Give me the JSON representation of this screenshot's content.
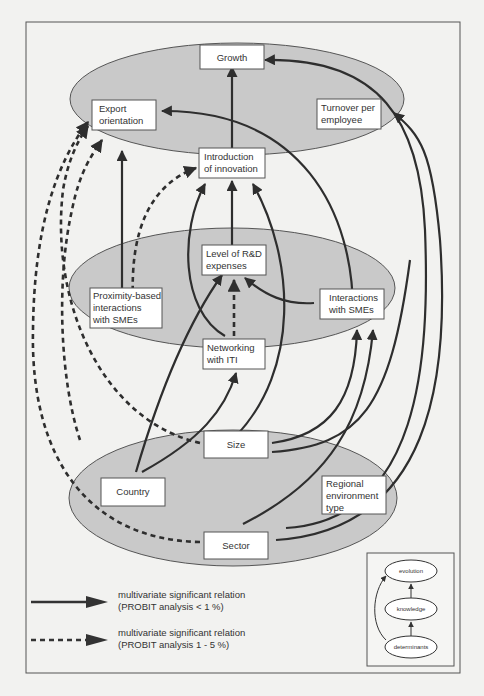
{
  "diagram": {
    "colors": {
      "background": "#f2f2f0",
      "ellipse_fill": "#c9c9c9",
      "line": "#2e2e2e",
      "box_fill": "#ffffff"
    },
    "levels": {
      "evolution": {
        "nodes": {
          "growth": "Growth",
          "export_orientation_l1": "Export",
          "export_orientation_l2": "orientation",
          "turnover_l1": "Turnover per",
          "turnover_l2": "employee",
          "innovation_l1": "Introduction",
          "innovation_l2": "of innovation"
        }
      },
      "knowledge": {
        "nodes": {
          "rd_l1": "Level of R&D",
          "rd_l2": "expenses",
          "proximity_l1": "Proximity-based",
          "proximity_l2": "interactions",
          "proximity_l3": "with SMEs",
          "sme_l1": "Interactions",
          "sme_l2": "with SMEs",
          "iti_l1": "Networking",
          "iti_l2": "with ITI"
        }
      },
      "determinants": {
        "nodes": {
          "size": "Size",
          "country": "Country",
          "regional_l1": "Regional",
          "regional_l2": "environment",
          "regional_l3": "type",
          "sector": "Sector"
        }
      }
    },
    "relations": [
      {
        "from": "Introduction of innovation",
        "to": "Growth",
        "type": "solid"
      },
      {
        "from": "Turnover per employee",
        "to": "Growth",
        "type": "solid"
      },
      {
        "from": "Introduction of innovation",
        "to": "Export orientation",
        "type": "solid"
      },
      {
        "from": "Proximity-based interactions with SMEs",
        "to": "Export orientation",
        "type": "solid"
      },
      {
        "from": "Proximity-based interactions with SMEs",
        "to": "Introduction of innovation",
        "type": "dashed"
      },
      {
        "from": "Level of R&D expenses",
        "to": "Introduction of innovation",
        "type": "solid"
      },
      {
        "from": "Networking with ITI",
        "to": "Introduction of innovation",
        "type": "solid"
      },
      {
        "from": "Size",
        "to": "Introduction of innovation",
        "type": "solid"
      },
      {
        "from": "Networking with ITI",
        "to": "Level of R&D expenses",
        "type": "dashed"
      },
      {
        "from": "Interactions with SMEs",
        "to": "Level of R&D expenses",
        "type": "solid"
      },
      {
        "from": "Country",
        "to": "Level of R&D expenses",
        "type": "solid"
      },
      {
        "from": "Country",
        "to": "Networking with ITI",
        "type": "solid"
      },
      {
        "from": "Size",
        "to": "Interactions with SMEs",
        "type": "solid"
      },
      {
        "from": "Sector",
        "to": "Interactions with SMEs",
        "type": "solid"
      },
      {
        "from": "Size",
        "to": "Export orientation",
        "type": "dashed"
      },
      {
        "from": "Sector",
        "to": "Export orientation",
        "type": "dashed"
      },
      {
        "from": "Size",
        "to": "Growth",
        "type": "solid"
      },
      {
        "from": "Sector",
        "to": "Turnover per employee",
        "type": "solid"
      }
    ],
    "legend": {
      "solid_l1": "multivariate significant relation",
      "solid_l2": "(PROBIT analysis < 1 %)",
      "dashed_l1": "multivariate significant relation",
      "dashed_l2": "(PROBIT analysis 1 - 5 %)"
    },
    "mini_map": {
      "top": "evolution",
      "middle": "knowledge",
      "bottom": "determinants"
    }
  }
}
